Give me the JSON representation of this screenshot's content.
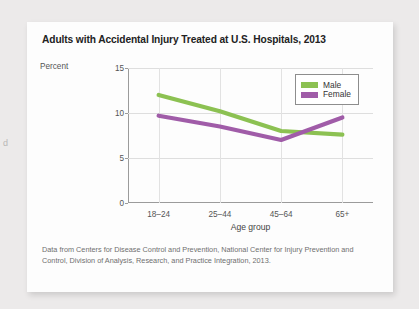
{
  "page_fragment": "d",
  "card": {
    "title": "Adults with Accidental Injury Treated at U.S. Hospitals, 2013",
    "source_note": "Data from Centers for Disease Control and Prevention, National Center for Injury Prevention and Control, Division of Analysis, Research, and Practice Integration, 2013."
  },
  "colors": {
    "male": "#8cc152",
    "female": "#a05ca8",
    "axis": "#9b9b9b",
    "grid": "#dedede",
    "card_background": "#fdfdfd",
    "page_background": "#eceaea"
  },
  "chart_data": {
    "type": "line",
    "title": "Adults with Accidental Injury Treated at U.S. Hospitals, 2013",
    "xlabel": "Age group",
    "ylabel": "Percent",
    "categories": [
      "18–24",
      "25–44",
      "45–64",
      "65+"
    ],
    "yticks": [
      0,
      5,
      10,
      15
    ],
    "ylim": [
      0,
      15
    ],
    "grid": true,
    "legend_position": "top-right",
    "series": [
      {
        "name": "Male",
        "color": "#8cc152",
        "values": [
          12.0,
          10.2,
          8.0,
          7.6
        ]
      },
      {
        "name": "Female",
        "color": "#a05ca8",
        "values": [
          9.7,
          8.5,
          7.0,
          9.5
        ]
      }
    ]
  }
}
